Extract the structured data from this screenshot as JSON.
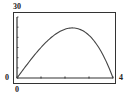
{
  "chart_data": {
    "type": "line",
    "title": "",
    "xlabel": "",
    "ylabel": "",
    "xlim": [
      0,
      4
    ],
    "ylim": [
      0,
      30
    ],
    "labels": {
      "y_max": "30",
      "y_min": "0",
      "x_min": "0",
      "x_max": "4"
    },
    "grid": false,
    "legend": null,
    "x_ticks": [
      0,
      1,
      2,
      3,
      4
    ],
    "series": [
      {
        "name": "f(x)",
        "x": [
          0,
          0.5,
          1,
          1.5,
          2,
          2.31,
          2.5,
          3,
          3.5,
          4
        ],
        "y": [
          0,
          7.9,
          15,
          20.6,
          24,
          24.6,
          24.4,
          21,
          13.1,
          0
        ]
      }
    ],
    "colors": {
      "curve": "#444444",
      "axes": "#333333",
      "frame": "#333333"
    }
  }
}
